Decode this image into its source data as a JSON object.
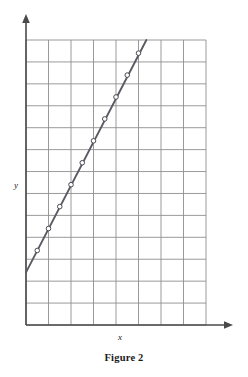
{
  "figure": {
    "caption": "Figure 2",
    "x_axis_label": "x",
    "y_axis_label": "y"
  },
  "colors": {
    "grid_line": "#8f8f8f",
    "axis_line": "#4a4a4a",
    "data_line": "#5a5a64",
    "marker_fill": "#ffffff",
    "marker_stroke": "#4a4a52",
    "background": "#ffffff",
    "text": "#1a1a1a"
  },
  "chart_data": {
    "type": "line",
    "title": "Figure 2",
    "xlabel": "x",
    "ylabel": "y",
    "grid": true,
    "legend": "none",
    "xlim": [
      0,
      8
    ],
    "ylim": [
      0,
      13
    ],
    "x_major_tick_step": 1,
    "y_major_tick_step": 1,
    "x_tick_labels": [],
    "y_tick_labels": [],
    "grid_columns": 8,
    "grid_rows": 13,
    "series": [
      {
        "name": "line",
        "marker": "open-circle",
        "x": [
          0.0,
          0.5,
          1.0,
          1.5,
          2.0,
          2.5,
          3.0,
          3.5,
          4.0,
          4.5,
          5.0,
          5.35
        ],
        "y": [
          2.4,
          3.4,
          4.4,
          5.4,
          6.4,
          7.4,
          8.4,
          9.4,
          10.4,
          11.4,
          12.4,
          13.0
        ],
        "marker_x": [
          0.5,
          1.0,
          1.5,
          2.0,
          2.5,
          3.0,
          3.5,
          4.0,
          4.5,
          5.0
        ],
        "marker_y": [
          3.4,
          4.4,
          5.4,
          6.4,
          7.4,
          8.4,
          9.4,
          10.4,
          11.4,
          12.4
        ],
        "slope": 2.0,
        "intercept": 2.4,
        "endpoints": [
          [
            0.0,
            2.4
          ],
          [
            5.35,
            13.0
          ]
        ]
      }
    ],
    "annotations": []
  },
  "geometry": {
    "plot_left": 26,
    "plot_top": 40,
    "plot_right": 206,
    "plot_bottom": 325,
    "cell_width": 22.5,
    "cell_height": 21.9,
    "y_axis_arrow_top": 15,
    "x_axis_arrow_right": 233
  }
}
